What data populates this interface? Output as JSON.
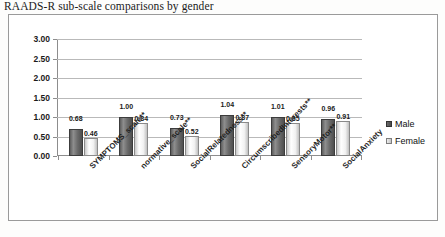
{
  "chart_data": {
    "type": "bar",
    "title": "RAADS-R sub-scale comparisons by gender",
    "xlabel": "",
    "ylabel": "",
    "ylim": [
      0,
      3.0
    ],
    "ytick_step": 0.5,
    "grid": true,
    "legend_position": "right",
    "categories": [
      "SYMPTOMS_scale**",
      "normative_scale**",
      "SocialRelatedness**",
      "CircumscribedInterests**",
      "SensoryMotor**",
      "SocialAnxiety"
    ],
    "ytick_labels": [
      "0.00",
      "0.50",
      "1.00",
      "1.50",
      "2.00",
      "2.50",
      "3.00"
    ],
    "series": [
      {
        "name": "Male",
        "values": [
          0.68,
          1.0,
          0.73,
          1.04,
          1.01,
          0.96
        ]
      },
      {
        "name": "Female",
        "values": [
          0.46,
          0.84,
          0.52,
          0.87,
          0.85,
          0.91
        ]
      }
    ],
    "data_labels": [
      [
        "0.68",
        "0.46"
      ],
      [
        "1.00",
        "0.84"
      ],
      [
        "0.73",
        "0.52"
      ],
      [
        "1.04",
        "0.87"
      ],
      [
        "1.01",
        "0.85"
      ],
      [
        "0.96",
        "0.91"
      ]
    ],
    "colors": {
      "male": "#5d5d5d",
      "female": "#f0f0f0",
      "grid": "#b9b9b9",
      "axis": "#8d8d8d",
      "frame": "#9a9a9a",
      "text": "#1a1a1a"
    }
  },
  "legend": {
    "items": [
      {
        "label": "Male"
      },
      {
        "label": "Female"
      }
    ]
  }
}
